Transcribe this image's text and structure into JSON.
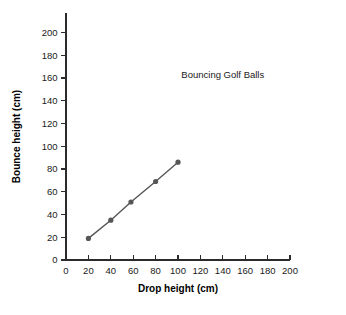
{
  "chart_data": {
    "type": "line",
    "title": "Bouncing Golf Balls",
    "xlabel": "Drop height (cm)",
    "ylabel": "Bounce height (cm)",
    "xlim": [
      0,
      200
    ],
    "ylim": [
      0,
      200
    ],
    "xticks": [
      0,
      20,
      40,
      60,
      80,
      100,
      120,
      140,
      160,
      180,
      200
    ],
    "yticks": [
      0,
      20,
      40,
      60,
      80,
      100,
      120,
      140,
      160,
      180,
      200
    ],
    "xtick_labels": [
      "0",
      "20",
      "40",
      "60",
      "80",
      "100",
      "120",
      "140",
      "160",
      "180",
      "200"
    ],
    "ytick_labels": [
      "0",
      "20",
      "40",
      "60",
      "80",
      "100",
      "120",
      "140",
      "160",
      "180",
      "200"
    ],
    "grid": false,
    "legend": null,
    "series": [
      {
        "name": "Bouncing Golf Balls",
        "marker": "circle",
        "color": "#565656",
        "x": [
          20,
          40,
          58,
          80,
          100
        ],
        "y": [
          19,
          35,
          51,
          69,
          86
        ],
        "points": [
          {
            "x": 20,
            "y": 19
          },
          {
            "x": 40,
            "y": 35
          },
          {
            "x": 58,
            "y": 51
          },
          {
            "x": 80,
            "y": 69
          },
          {
            "x": 100,
            "y": 86
          }
        ]
      }
    ],
    "annotations": [
      {
        "text": "Bouncing Golf Balls",
        "x": 140,
        "y": 160
      }
    ]
  },
  "colors": {
    "series": "#565656",
    "axis": "#2b2b2b",
    "text": "#1a1a1a",
    "background": "#ffffff"
  }
}
